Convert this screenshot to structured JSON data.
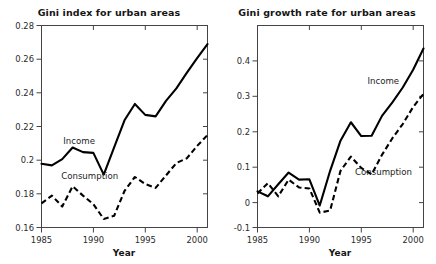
{
  "figure": {
    "width": 436,
    "height": 264,
    "background": "#ffffff",
    "line_color": "#000000",
    "axis_color": "#444444"
  },
  "chart_data": [
    {
      "type": "line",
      "title": "Gini index for urban areas",
      "xlabel": "Year",
      "ylabel": "",
      "xlim": [
        1985,
        2001
      ],
      "ylim": [
        0.15,
        0.28
      ],
      "xticks": [
        1985,
        1990,
        1995,
        2000
      ],
      "yticks": [
        0.16,
        0.18,
        0.2,
        0.22,
        0.24,
        0.26,
        0.28
      ],
      "xtick_labels": [
        "1985",
        "1990",
        "1995",
        "2000"
      ],
      "ytick_labels": [
        "0.16",
        "0.18",
        "0.2",
        "0.22",
        "0.24",
        "0.26",
        "0.28"
      ],
      "grid": false,
      "legend_position": "inline-annotation",
      "x": [
        1985,
        1986,
        1987,
        1988,
        1989,
        1990,
        1991,
        1992,
        1993,
        1994,
        1995,
        1996,
        1997,
        1998,
        1999,
        2000,
        2001
      ],
      "series": [
        {
          "name": "Income",
          "style": "solid",
          "label_x": 1987.1,
          "label_y": 0.2035,
          "values": [
            0.191,
            0.19,
            0.194,
            0.2015,
            0.1985,
            0.198,
            0.184,
            0.2015,
            0.219,
            0.2295,
            0.2225,
            0.2215,
            0.2315,
            0.2395,
            0.2495,
            0.259,
            0.268
          ]
        },
        {
          "name": "Consumption",
          "style": "dashed",
          "label_x": 1986.9,
          "label_y": 0.1815,
          "values": [
            0.1655,
            0.1705,
            0.1635,
            0.1765,
            0.1705,
            0.165,
            0.1555,
            0.1575,
            0.1735,
            0.1825,
            0.178,
            0.1755,
            0.1835,
            0.1915,
            0.1945,
            0.2025,
            0.2095
          ]
        }
      ]
    },
    {
      "type": "line",
      "title": "Gini growth rate for urban areas",
      "xlabel": "Year",
      "ylabel": "",
      "xlim": [
        1985,
        2001
      ],
      "ylim": [
        -0.1,
        0.47
      ],
      "xticks": [
        1985,
        1990,
        1995,
        2000
      ],
      "yticks": [
        -0.1,
        0,
        0.1,
        0.2,
        0.3,
        0.4
      ],
      "xtick_labels": [
        "1985",
        "1990",
        "1995",
        "2000"
      ],
      "ytick_labels": [
        "-0.1",
        "0",
        "0.1",
        "0.2",
        "0.3",
        "0.4"
      ],
      "grid": false,
      "legend_position": "inline-annotation",
      "x": [
        1985,
        1986,
        1987,
        1988,
        1989,
        1990,
        1991,
        1992,
        1993,
        1994,
        1995,
        1996,
        1997,
        1998,
        1999,
        2000,
        2001
      ],
      "series": [
        {
          "name": "Income",
          "style": "solid",
          "label_x": 1995.6,
          "label_y": 0.305,
          "values": [
            0.002,
            -0.012,
            0.022,
            0.055,
            0.035,
            0.036,
            -0.038,
            0.06,
            0.145,
            0.197,
            0.158,
            0.159,
            0.215,
            0.253,
            0.295,
            0.345,
            0.405
          ]
        },
        {
          "name": "Consumption",
          "style": "dashed",
          "label_x": 1994.4,
          "label_y": 0.048,
          "values": [
            -0.004,
            0.025,
            -0.012,
            0.035,
            0.013,
            0.01,
            -0.058,
            -0.052,
            0.06,
            0.1,
            0.068,
            0.05,
            0.105,
            0.152,
            0.192,
            0.24,
            0.277
          ]
        }
      ]
    }
  ]
}
